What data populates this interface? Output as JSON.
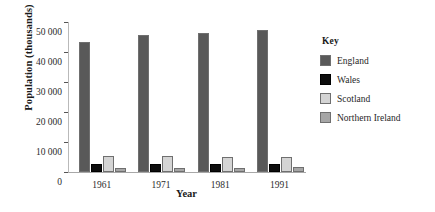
{
  "chart_data": {
    "type": "bar",
    "title": "",
    "xlabel": "Year",
    "ylabel": "Population (thousands)",
    "categories": [
      "1961",
      "1971",
      "1981",
      "1991"
    ],
    "ylim": [
      0,
      50000
    ],
    "ytick_labels": [
      "50 000",
      "40 000",
      "30 000",
      "20 000",
      "10 000",
      "0"
    ],
    "ytick_values": [
      50000,
      40000,
      30000,
      20000,
      10000,
      0
    ],
    "grid": false,
    "legend_position": "right",
    "legend_title": "Key",
    "series": [
      {
        "name": "England",
        "color": "#595959",
        "values": [
          43300,
          45700,
          46300,
          47500
        ]
      },
      {
        "name": "Wales",
        "color": "#0d0d0d",
        "values": [
          2700,
          2700,
          2800,
          2800
        ]
      },
      {
        "name": "Scotland",
        "color": "#d4d4d4",
        "values": [
          5200,
          5200,
          5100,
          5000
        ]
      },
      {
        "name": "Northern Ireland",
        "color": "#a6a6a6",
        "values": [
          1400,
          1500,
          1500,
          1600
        ]
      }
    ]
  },
  "colors": {
    "england": "#595959",
    "wales": "#0d0d0d",
    "scotland": "#d4d4d4",
    "northern_ireland": "#a6a6a6",
    "axis": "#a8a8a8",
    "text": "#1a1a1a",
    "background": "#ffffff"
  }
}
